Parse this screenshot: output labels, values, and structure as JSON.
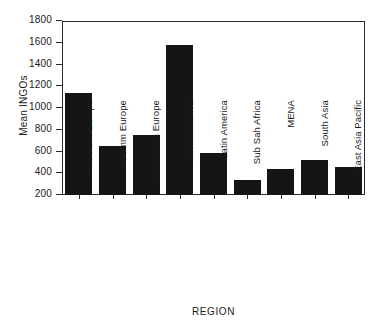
{
  "chart_data": {
    "type": "bar",
    "title": "",
    "xlabel": "REGION",
    "ylabel": "Mean INGOs",
    "categories": [
      "Western Europe",
      "Comm Europe",
      "Post-Comm Europe",
      "North America",
      "Latin America",
      "Sub Sah Africa",
      "MENA",
      "South Asia",
      "East Asia Pacific"
    ],
    "values": [
      1140,
      655,
      750,
      1580,
      590,
      335,
      440,
      525,
      460
    ],
    "ylim": [
      200,
      1800
    ],
    "yticks": [
      200,
      400,
      600,
      800,
      1000,
      1200,
      1400,
      1600,
      1800
    ],
    "grid": false,
    "legend": "none",
    "bar_color": "#151515",
    "axis_color": "#2b2b2b",
    "background": "#ffffff"
  }
}
